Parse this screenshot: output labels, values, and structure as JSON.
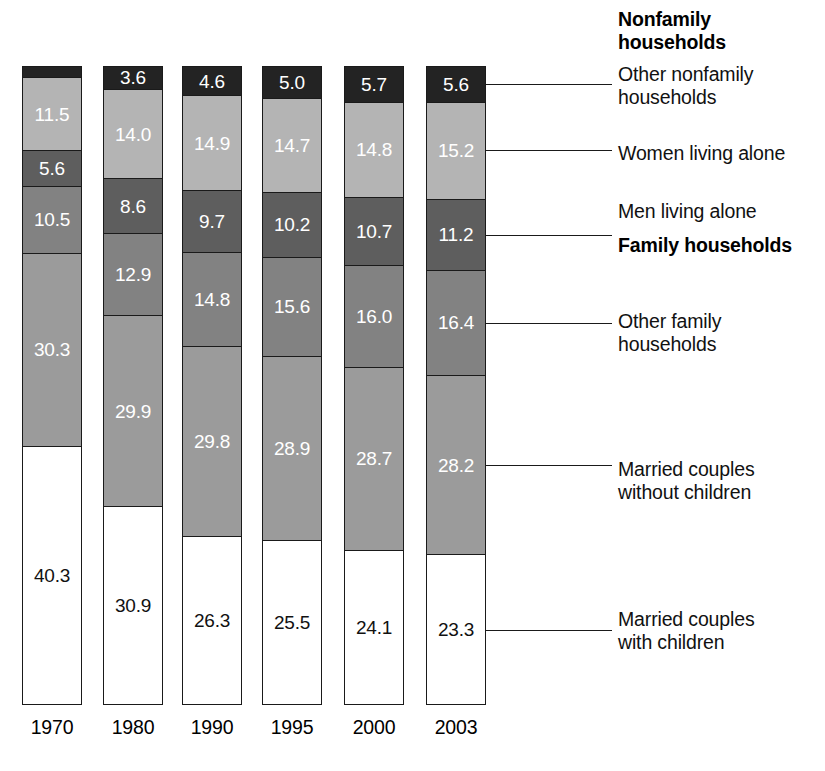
{
  "chart_data": {
    "type": "bar",
    "subtype": "stacked-bar-100-percent",
    "title": "",
    "subtitle": "",
    "xlabel": "",
    "ylabel": "",
    "ylim": [
      0,
      100
    ],
    "grid": false,
    "legend_position": "right",
    "categories": [
      "1970",
      "1980",
      "1990",
      "1995",
      "2000",
      "2003"
    ],
    "stack_order_bottom_to_top": [
      "Married couples with children",
      "Married couples without children",
      "Other family households",
      "Men living alone",
      "Women living alone",
      "Other nonfamily households"
    ],
    "series": [
      {
        "name": "Married couples with children",
        "key": "married-with",
        "color": "#ffffff",
        "label_color": "#111111",
        "values": [
          40.3,
          30.9,
          26.3,
          25.5,
          24.1,
          23.3
        ],
        "value_labels": [
          "40.3",
          "30.9",
          "26.3",
          "25.5",
          "24.1",
          "23.3"
        ]
      },
      {
        "name": "Married couples without children",
        "key": "married-without",
        "color": "#9b9b9b",
        "label_color": "#ffffff",
        "values": [
          30.3,
          29.9,
          29.8,
          28.9,
          28.7,
          28.2
        ],
        "value_labels": [
          "30.3",
          "29.9",
          "29.8",
          "28.9",
          "28.7",
          "28.2"
        ]
      },
      {
        "name": "Other family households",
        "key": "other-family",
        "color": "#828282",
        "label_color": "#ffffff",
        "values": [
          10.5,
          12.9,
          14.8,
          15.6,
          16.0,
          16.4
        ],
        "value_labels": [
          "10.5",
          "12.9",
          "14.8",
          "15.6",
          "16.0",
          "16.4"
        ]
      },
      {
        "name": "Men living alone",
        "key": "men-alone",
        "color": "#5e5e5e",
        "label_color": "#ffffff",
        "values": [
          5.6,
          8.6,
          9.7,
          10.2,
          10.7,
          11.2
        ],
        "value_labels": [
          "5.6",
          "8.6",
          "9.7",
          "10.2",
          "10.7",
          "11.2"
        ]
      },
      {
        "name": "Women living alone",
        "key": "women-alone",
        "color": "#b4b4b4",
        "label_color": "#ffffff",
        "values": [
          11.5,
          14.0,
          14.9,
          14.7,
          14.8,
          15.2
        ],
        "value_labels": [
          "11.5",
          "14.0",
          "14.9",
          "14.7",
          "14.8",
          "15.2"
        ]
      },
      {
        "name": "Other nonfamily households",
        "key": "other-nonfamily",
        "color": "#232323",
        "label_color": "#ffffff",
        "values": [
          1.7,
          3.6,
          4.6,
          5.0,
          5.7,
          5.6
        ],
        "value_labels": [
          "1.7",
          "3.6",
          "4.6",
          "5.0",
          "5.7",
          "5.6"
        ],
        "label_outside": [
          true,
          false,
          false,
          false,
          false,
          false
        ]
      }
    ]
  },
  "axis": {
    "x_tick_labels": [
      "1970",
      "1980",
      "1990",
      "1995",
      "2000",
      "2003"
    ]
  },
  "legend": {
    "entries": [
      {
        "text": "Nonfamily\nhouseholds",
        "heading": true,
        "leader": false
      },
      {
        "text": "Other nonfamily\nhouseholds",
        "heading": false,
        "leader": true
      },
      {
        "text": "Women living alone",
        "heading": false,
        "leader": true
      },
      {
        "text": "Men living alone",
        "heading": false,
        "leader": true
      },
      {
        "text": "Family households",
        "heading": true,
        "leader": false
      },
      {
        "text": "Other family\nhouseholds",
        "heading": false,
        "leader": true
      },
      {
        "text": "Married couples\nwithout children",
        "heading": false,
        "leader": true
      },
      {
        "text": "Married couples\nwith children",
        "heading": false,
        "leader": true
      }
    ]
  },
  "colors": {
    "other_nonfamily": "#232323",
    "women_alone": "#b4b4b4",
    "men_alone": "#5e5e5e",
    "other_family": "#828282",
    "married_without_children": "#9b9b9b",
    "married_with_children": "#ffffff",
    "outline": "#1a1a1a",
    "background": "#ffffff"
  }
}
